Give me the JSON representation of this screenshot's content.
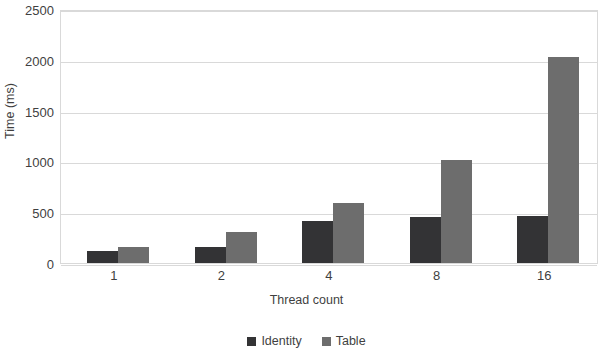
{
  "chart_data": {
    "type": "bar",
    "title": "",
    "categories": [
      "1",
      "2",
      "4",
      "8",
      "16"
    ],
    "series": [
      {
        "name": "Identity",
        "color": "#333335",
        "values": [
          120,
          155,
          410,
          455,
          465
        ]
      },
      {
        "name": "Table",
        "color": "#6d6d6d",
        "values": [
          155,
          310,
          590,
          1015,
          2030
        ]
      }
    ],
    "xlabel": "Thread count",
    "ylabel": "Time (ms)",
    "ylim": [
      0,
      2500
    ],
    "yticks": [
      0,
      500,
      1000,
      1500,
      2000,
      2500
    ],
    "ytick_labels": [
      "0",
      "500",
      "1000",
      "1500",
      "2000",
      "2500"
    ],
    "grid": "horizontal",
    "legend_position": "bottom"
  }
}
